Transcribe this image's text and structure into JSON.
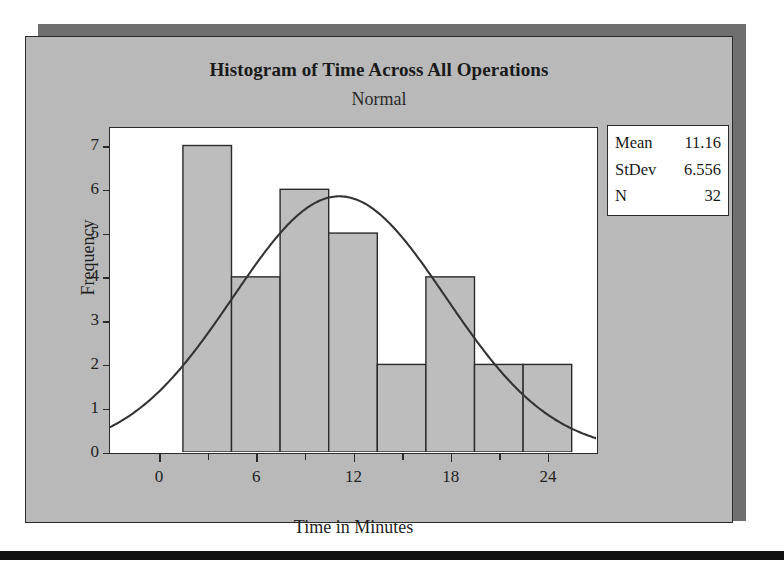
{
  "chart_data": {
    "type": "bar",
    "title": "Histogram of Time Across All Operations",
    "subtitle": "Normal",
    "xlabel": "Time in Minutes",
    "ylabel": "Frequency",
    "xlim": [
      -3.0,
      27.0
    ],
    "ylim": [
      0,
      7.4
    ],
    "grid": false,
    "bin_width": 3,
    "bin_starts": [
      1.5,
      4.5,
      7.5,
      10.5,
      13.5,
      16.5,
      19.5,
      22.5
    ],
    "bin_centers": [
      3,
      6,
      9,
      12,
      15,
      18,
      21,
      24
    ],
    "values": [
      7,
      4,
      6,
      5,
      2,
      4,
      2,
      2
    ],
    "categories": [
      "1.5-4.5",
      "4.5-7.5",
      "7.5-10.5",
      "10.5-13.5",
      "13.5-16.5",
      "16.5-19.5",
      "19.5-22.5",
      "22.5-25.5"
    ],
    "xticks": [
      0,
      6,
      12,
      18,
      24
    ],
    "xtick_labels": [
      "0",
      "6",
      "12",
      "18",
      "24"
    ],
    "xminorticks": [
      3,
      9,
      15,
      21
    ],
    "yticks": [
      0,
      1,
      2,
      3,
      4,
      5,
      6,
      7
    ],
    "ytick_labels": [
      "0",
      "1",
      "2",
      "3",
      "4",
      "5",
      "6",
      "7"
    ],
    "overlay": {
      "type": "line",
      "name": "Normal",
      "distribution": "normal",
      "mean": 11.16,
      "stdev": 6.556,
      "n": 32,
      "peak_value": 5.84
    },
    "colors": {
      "bar_fill": "#bdbdbd",
      "bar_edge": "#2b2b2b",
      "curve": "#333333",
      "plot_background": "#ffffff",
      "panel_background": "#b9b9b9",
      "shadow": "#6f6f6f",
      "bottom_rule": "#111111",
      "text": "#1a1a1a"
    }
  },
  "stats": {
    "title": "Normal",
    "rows": [
      {
        "key": "Mean",
        "value": "11.16"
      },
      {
        "key": "StDev",
        "value": "6.556"
      },
      {
        "key": "N",
        "value": "32"
      }
    ]
  }
}
